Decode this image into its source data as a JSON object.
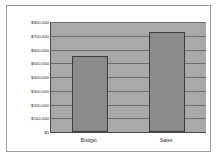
{
  "chart_data": {
    "type": "bar",
    "title": "",
    "subtitle": "",
    "xlabel": "",
    "ylabel": "",
    "categories": [
      "Budget",
      "Sales"
    ],
    "values": [
      550000,
      730000
    ],
    "series": [
      {
        "name": "",
        "values": [
          550000,
          730000
        ]
      }
    ],
    "ylim": [
      0,
      800000
    ],
    "ytick_values": [
      0,
      100000,
      200000,
      300000,
      400000,
      500000,
      600000,
      700000,
      800000
    ],
    "ytick_labels": [
      "$0",
      "$100,000",
      "$200,000",
      "$300,000",
      "$400,000",
      "$500,000",
      "$600,000",
      "$700,000",
      "$800,000"
    ],
    "grid": true,
    "grid_axis": "y",
    "legend": false,
    "legend_position": "none",
    "colors": {
      "bar_fill": "#8b8b8b",
      "bar_border": "#3d3d3d",
      "plot_background": "#a9a9a9",
      "gridline": "#6e6e6e",
      "axis_line": "#4a4a4a",
      "frame_border": "#9a9a9a",
      "page_background": "#ffffff",
      "tick_label": "#2b2b2b"
    }
  }
}
